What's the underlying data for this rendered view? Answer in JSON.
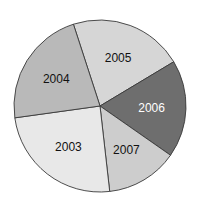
{
  "chart_data": {
    "type": "pie",
    "title": "",
    "start_angle_deg": 342,
    "direction": "clockwise",
    "slices": [
      {
        "label": "2005",
        "value": 21.4,
        "color": "#d6d6d6",
        "text_color": "#111111"
      },
      {
        "label": "2006",
        "value": 18.3,
        "color": "#6e6e6e",
        "text_color": "#ffffff"
      },
      {
        "label": "2007",
        "value": 13.5,
        "color": "#cdcdcd",
        "text_color": "#111111"
      },
      {
        "label": "2003",
        "value": 24.6,
        "color": "#e8e8e8",
        "text_color": "#111111"
      },
      {
        "label": "2004",
        "value": 22.2,
        "color": "#b9b9b9",
        "text_color": "#111111"
      }
    ],
    "legend": "none",
    "units": "percent (estimated)"
  }
}
